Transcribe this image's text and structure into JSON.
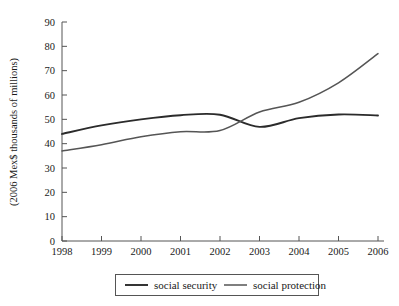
{
  "chart_data": {
    "type": "line",
    "title": "",
    "xlabel": "",
    "ylabel": "(2006 Mex$ thousands of millions)",
    "x": [
      1998,
      1999,
      2000,
      2001,
      2002,
      2003,
      2004,
      2005,
      2006
    ],
    "xtick_labels": [
      "1998",
      "1999",
      "2000",
      "2001",
      "2002",
      "2003",
      "2004",
      "2005",
      "2006"
    ],
    "ytick_labels": [
      "0",
      "10",
      "20",
      "30",
      "40",
      "50",
      "60",
      "70",
      "80",
      "90"
    ],
    "yticks": [
      0,
      10,
      20,
      30,
      40,
      50,
      60,
      70,
      80,
      90
    ],
    "ylim": [
      0,
      90
    ],
    "xlim": [
      1998,
      2006
    ],
    "grid": false,
    "legend_position": "bottom",
    "series": [
      {
        "name": "social security",
        "color": "#2b2b2b",
        "values": [
          44.0,
          47.5,
          50.0,
          51.7,
          51.9,
          46.9,
          50.5,
          52.0,
          51.6
        ]
      },
      {
        "name": "social protection",
        "color": "#555555",
        "values": [
          37.0,
          39.6,
          42.8,
          44.9,
          45.4,
          53.0,
          57.0,
          65.0,
          77.0
        ]
      }
    ]
  },
  "legend": {
    "entries": [
      {
        "label": "social security",
        "swatch": "line-swatch-dark"
      },
      {
        "label": "social protection",
        "swatch": "line-swatch-gray"
      }
    ]
  },
  "axes": {
    "y_axis_title": "(2006 Mex$ thousands of millions)"
  }
}
